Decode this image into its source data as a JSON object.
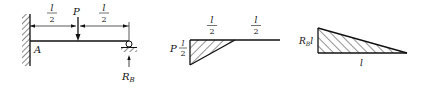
{
  "beam": {
    "support_label": "A",
    "load_label": "P",
    "reaction_label": "R",
    "reaction_sub": "B",
    "span_left": {
      "num": "l",
      "den": "2"
    },
    "span_right": {
      "num": "l",
      "den": "2"
    }
  },
  "moment_diagram_load": {
    "left_value_coef": "P",
    "left_value": {
      "num": "l",
      "den": "2"
    },
    "segment_left": {
      "num": "l",
      "den": "2"
    },
    "segment_right": {
      "num": "l",
      "den": "2"
    }
  },
  "moment_diagram_reaction": {
    "value_prefix": "R",
    "value_sub": "B",
    "value_suffix": "l",
    "length_label": "l"
  },
  "colors": {
    "line": "#111111",
    "background": "#ffffff"
  }
}
